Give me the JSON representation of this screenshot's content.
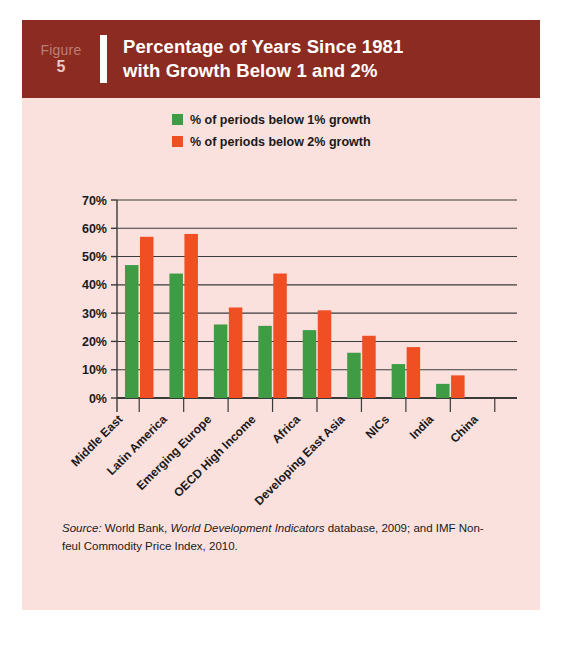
{
  "figure": {
    "label_word": "Figure",
    "number": "5",
    "title_line1": "Percentage of Years Since 1981",
    "title_line2": "with Growth Below 1 and 2%",
    "header_color": "#8c2b21",
    "panel_color": "#fae1de"
  },
  "legend": {
    "position": "top-center",
    "items": [
      {
        "label": "% of periods below 1% growth",
        "color": "#3f9c45"
      },
      {
        "label": "% of periods below 2% growth",
        "color": "#f04e23"
      }
    ]
  },
  "source": {
    "prefix": "Source:",
    "text_part1": " World Bank, ",
    "italic_title": "World Development Indicators",
    "text_part2": " database, 2009; and IMF Non-feul Commodity Price Index, 2010."
  },
  "chart_data": {
    "type": "bar",
    "title": "Percentage of Years Since 1981 with Growth Below 1 and 2%",
    "xlabel": "",
    "ylabel": "",
    "ylim": [
      0,
      70
    ],
    "ytick_step": 10,
    "grid": true,
    "ytick_labels": [
      "70%",
      "60%",
      "50%",
      "40%",
      "30%",
      "20%",
      "10%",
      "0%"
    ],
    "categories": [
      "Middle East",
      "Latin America",
      "Emerging Europe",
      "OECD High Income",
      "Africa",
      "Developing East Asia",
      "NICs",
      "India",
      "China"
    ],
    "series": [
      {
        "name": "% of periods below 1% growth",
        "color": "#3f9c45",
        "values": [
          47,
          44,
          26,
          25.5,
          24,
          16,
          12,
          5,
          0
        ]
      },
      {
        "name": "% of periods below 2% growth",
        "color": "#f04e23",
        "values": [
          57,
          58,
          32,
          44,
          31,
          22,
          18,
          8,
          0
        ]
      }
    ]
  }
}
